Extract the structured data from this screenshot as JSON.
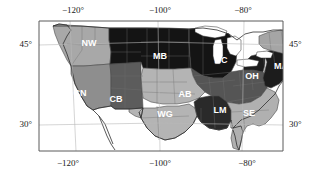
{
  "figure": {
    "kind": "map",
    "projection_frame_color": "#5a5a5a",
    "background": "#ffffff",
    "ocean_color": "#ffffff"
  },
  "axes": {
    "top_ticks": [
      {
        "label": "−120°",
        "x_px": 73
      },
      {
        "label": "−100°",
        "x_px": 160
      },
      {
        "label": "−80°",
        "x_px": 243
      }
    ],
    "bottom_ticks": [
      {
        "label": "−120°",
        "x_px": 68
      },
      {
        "label": "−100°",
        "x_px": 160
      },
      {
        "label": "−80°",
        "x_px": 247
      }
    ],
    "left_ticks": [
      {
        "label": "45°",
        "y_px": 44
      },
      {
        "label": "30°",
        "y_px": 124
      }
    ],
    "right_ticks": [
      {
        "label": "45°",
        "y_px": 44
      },
      {
        "label": "30°",
        "y_px": 124
      }
    ],
    "lon_range": [
      -127,
      -65
    ],
    "lat_range": [
      23,
      50
    ],
    "gridlines": true,
    "grid_color": "#b8b8b8"
  },
  "regions": [
    {
      "code": "NW",
      "name": "Northwest",
      "fill": "#a8a8a8",
      "label_x": 52,
      "label_y": 24
    },
    {
      "code": "CN",
      "name": "California-Nevada",
      "fill": "#8e8e8e",
      "label_x": 43,
      "label_y": 74
    },
    {
      "code": "CB",
      "name": "Colorado Basin",
      "fill": "#5c5c5c",
      "label_x": 79,
      "label_y": 80
    },
    {
      "code": "MB",
      "name": "Missouri Basin",
      "fill": "#141414",
      "label_x": 123,
      "label_y": 37
    },
    {
      "code": "NC",
      "name": "North Central",
      "fill": "#141414",
      "label_x": 184,
      "label_y": 41
    },
    {
      "code": "OH",
      "name": "Ohio Valley",
      "fill": "#555555",
      "label_x": 215,
      "label_y": 57
    },
    {
      "code": "MA",
      "name": "Mid-Atlantic",
      "fill": "#1c1c1c",
      "label_x": 244,
      "label_y": 47
    },
    {
      "code": "NE",
      "name": "Northeast",
      "fill": "#a5a5a5",
      "label_x": 261,
      "label_y": 35
    },
    {
      "code": "AB",
      "name": "Arkansas Basin",
      "fill": "#b4b4b4",
      "label_x": 148,
      "label_y": 75
    },
    {
      "code": "WG",
      "name": "Western Gulf",
      "fill": "#b4b4b4",
      "label_x": 128,
      "label_y": 95
    },
    {
      "code": "LM",
      "name": "Lower Mississippi",
      "fill": "#2a2a2a",
      "label_x": 183,
      "label_y": 91
    },
    {
      "code": "SE",
      "name": "Southeast",
      "fill": "#b0b0b0",
      "label_x": 212,
      "label_y": 94
    }
  ],
  "colors": {
    "very_dark": "#141414",
    "dark": "#2a2a2a",
    "medium_dark": "#555555",
    "medium": "#8e8e8e",
    "light_medium": "#a8a8a8",
    "light": "#b4b4b4",
    "outline": "#4a4a4a",
    "state_border": "#6e6e6e",
    "coast": "#2e2e2e",
    "label_text": "#ffffff",
    "tick_text": "#1a1a1a"
  }
}
